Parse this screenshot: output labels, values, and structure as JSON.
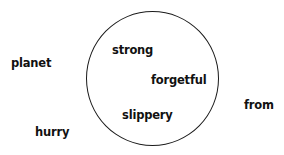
{
  "diagram": {
    "type": "set-sorting",
    "circle": {
      "label": ""
    },
    "inside_words": [
      {
        "text": "strong",
        "x": 112,
        "y": 43
      },
      {
        "text": "forgetful",
        "x": 151,
        "y": 73
      },
      {
        "text": "slippery",
        "x": 122,
        "y": 108
      }
    ],
    "outside_words": [
      {
        "text": "planet",
        "x": 11,
        "y": 56
      },
      {
        "text": "hurry",
        "x": 35,
        "y": 125
      },
      {
        "text": "from",
        "x": 244,
        "y": 98
      }
    ]
  }
}
